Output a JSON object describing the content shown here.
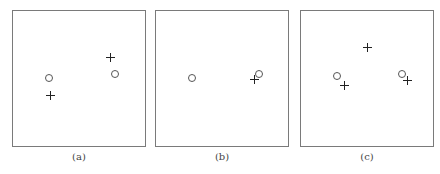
{
  "figure": {
    "panels": [
      {
        "id": "a",
        "caption": "(a)",
        "box": {
          "left": 12,
          "top": 10,
          "width": 134,
          "height": 137
        },
        "circles": [
          {
            "x": 49,
            "y": 78
          },
          {
            "x": 115,
            "y": 74
          }
        ],
        "pluses": [
          {
            "x": 50,
            "y": 95
          },
          {
            "x": 110,
            "y": 57
          }
        ]
      },
      {
        "id": "b",
        "caption": "(b)",
        "box": {
          "left": 155,
          "top": 10,
          "width": 134,
          "height": 137
        },
        "circles": [
          {
            "x": 192,
            "y": 78
          },
          {
            "x": 259,
            "y": 74
          }
        ],
        "pluses": [
          {
            "x": 254,
            "y": 79
          }
        ]
      },
      {
        "id": "c",
        "caption": "(c)",
        "box": {
          "left": 300,
          "top": 10,
          "width": 134,
          "height": 137
        },
        "circles": [
          {
            "x": 337,
            "y": 76
          },
          {
            "x": 402,
            "y": 74
          }
        ],
        "pluses": [
          {
            "x": 367,
            "y": 47
          },
          {
            "x": 344,
            "y": 85
          },
          {
            "x": 407,
            "y": 80
          }
        ]
      }
    ],
    "legend_semantics": {
      "circle-marker": "open circle point",
      "plus-marker": "plus point"
    }
  }
}
